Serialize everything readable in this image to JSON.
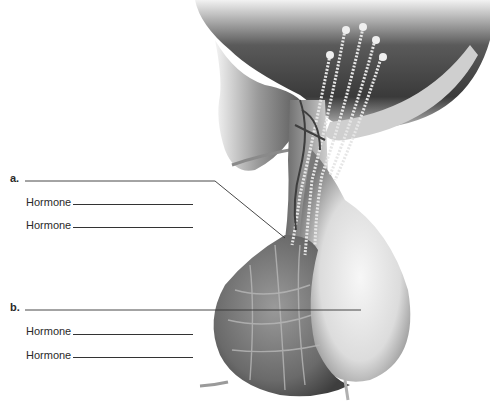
{
  "diagram": {
    "labels": [
      {
        "letter": "a.",
        "target": "anterior lobe stalk / portal vessels",
        "hormones": [
          {
            "prefix": "Hormone",
            "value": ""
          },
          {
            "prefix": "Hormone",
            "value": ""
          }
        ]
      },
      {
        "letter": "b.",
        "target": "posterior lobe",
        "hormones": [
          {
            "prefix": "Hormone",
            "value": ""
          },
          {
            "prefix": "Hormone",
            "value": ""
          }
        ]
      }
    ],
    "colors": {
      "background": "#ffffff",
      "tissue_dark": "#4a4a4a",
      "tissue_mid": "#8a8a8a",
      "tissue_light": "#e8e8e8",
      "leader_line": "#333333"
    }
  }
}
